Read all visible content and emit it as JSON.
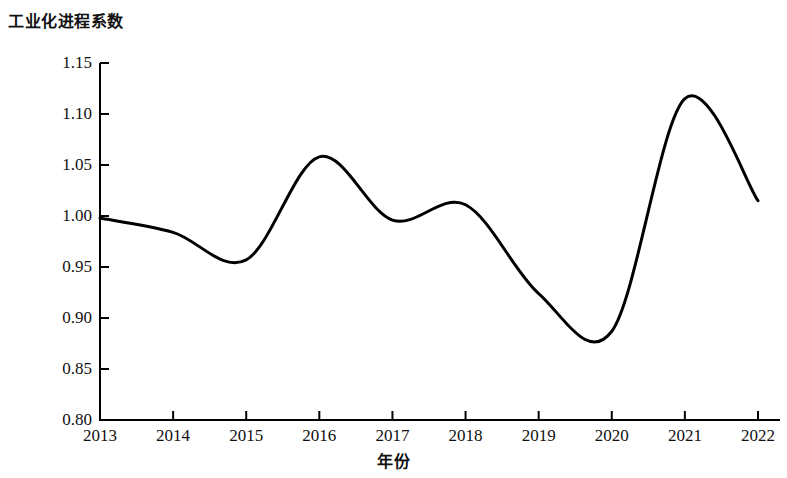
{
  "chart_data": {
    "type": "line",
    "title": "工业化进程系数",
    "xlabel": "年份",
    "ylabel": "",
    "categories": [
      "2013",
      "2014",
      "2015",
      "2016",
      "2017",
      "2018",
      "2019",
      "2020",
      "2021",
      "2022"
    ],
    "x": [
      2013,
      2014,
      2015,
      2016,
      2017,
      2018,
      2019,
      2020,
      2021,
      2022
    ],
    "values": [
      0.998,
      0.984,
      0.957,
      1.058,
      0.996,
      1.011,
      0.924,
      0.887,
      1.115,
      1.015
    ],
    "series": [
      {
        "name": "工业化进程系数",
        "values": [
          0.998,
          0.984,
          0.957,
          1.058,
          0.996,
          1.011,
          0.924,
          0.887,
          1.115,
          1.015
        ],
        "color": "#000000"
      }
    ],
    "ylim": [
      0.8,
      1.15
    ],
    "xlim": [
      2013,
      2022
    ],
    "yticks": [
      "0.80",
      "0.85",
      "0.90",
      "0.95",
      "1.00",
      "1.05",
      "1.10",
      "1.15"
    ],
    "ytick_values": [
      0.8,
      0.85,
      0.9,
      0.95,
      1.0,
      1.05,
      1.1,
      1.15
    ],
    "xticks": [
      "2013",
      "2014",
      "2015",
      "2016",
      "2017",
      "2018",
      "2019",
      "2020",
      "2021",
      "2022"
    ],
    "grid": false,
    "legend": false,
    "smoothing": "spline",
    "line_width": 3,
    "axis_color": "#000000",
    "background": "#ffffff"
  }
}
